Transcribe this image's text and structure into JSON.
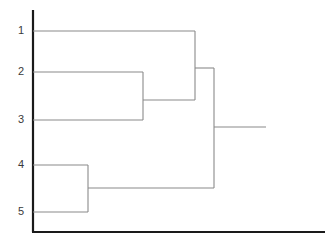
{
  "chart_data": {
    "type": "dendrogram",
    "title": "",
    "xlabel": "",
    "ylabel": "",
    "grid": false,
    "legend": null,
    "leaf_labels": [
      "1",
      "2",
      "3",
      "4",
      "5"
    ],
    "leaf_positions_px": [
      31,
      72,
      120,
      165,
      212
    ],
    "axis": {
      "vertical_x_px": 33,
      "vertical_y_top_px": 10,
      "vertical_y_bottom_px": 232,
      "horizontal_y_px": 232,
      "horizontal_x_end_px": 325,
      "color": "#1a1a1a"
    },
    "orientation": "horizontal-left-to-right",
    "link_color": "#8a8a8a",
    "merges": [
      {
        "id": "m1",
        "label": "merge-2-3",
        "members": [
          "2",
          "3"
        ],
        "height_px": 143,
        "child_y_px": [
          72,
          120
        ],
        "branch_y_px": 100
      },
      {
        "id": "m2",
        "label": "merge-1-with-23",
        "members": [
          "1",
          "2",
          "3"
        ],
        "height_px": 195,
        "child_y_px": [
          31,
          100
        ],
        "branch_y_px": 68
      },
      {
        "id": "m3",
        "label": "merge-4-5",
        "members": [
          "4",
          "5"
        ],
        "height_px": 88,
        "child_y_px": [
          165,
          212
        ],
        "branch_y_px": 188
      },
      {
        "id": "m4",
        "label": "root-merge-123-with-45",
        "members": [
          "1",
          "2",
          "3",
          "4",
          "5"
        ],
        "height_px": 214,
        "child_y_px": [
          68,
          188
        ],
        "branch_y_px": 127,
        "root_stub_x_end_px": 266
      }
    ],
    "segments": [
      {
        "name": "leaf-1-branch",
        "x1": 33,
        "y1": 31,
        "x2": 195,
        "y2": 31
      },
      {
        "name": "leaf-2-branch",
        "x1": 33,
        "y1": 72,
        "x2": 143,
        "y2": 72
      },
      {
        "name": "leaf-3-branch",
        "x1": 33,
        "y1": 120,
        "x2": 143,
        "y2": 120
      },
      {
        "name": "leaf-4-branch",
        "x1": 33,
        "y1": 165,
        "x2": 88,
        "y2": 165
      },
      {
        "name": "leaf-5-branch",
        "x1": 33,
        "y1": 212,
        "x2": 88,
        "y2": 212
      },
      {
        "name": "merge-2-3-vertical",
        "x1": 143,
        "y1": 72,
        "x2": 143,
        "y2": 120
      },
      {
        "name": "merge-2-3-branch",
        "x1": 143,
        "y1": 100,
        "x2": 195,
        "y2": 100
      },
      {
        "name": "merge-1-23-vertical",
        "x1": 195,
        "y1": 31,
        "x2": 195,
        "y2": 100
      },
      {
        "name": "merge-1-23-branch",
        "x1": 195,
        "y1": 68,
        "x2": 214,
        "y2": 68
      },
      {
        "name": "merge-4-5-vertical",
        "x1": 88,
        "y1": 165,
        "x2": 88,
        "y2": 212
      },
      {
        "name": "merge-4-5-branch",
        "x1": 88,
        "y1": 188,
        "x2": 214,
        "y2": 188
      },
      {
        "name": "root-vertical",
        "x1": 214,
        "y1": 68,
        "x2": 214,
        "y2": 188
      },
      {
        "name": "root-stub",
        "x1": 214,
        "y1": 127,
        "x2": 266,
        "y2": 127
      }
    ]
  },
  "labels": {
    "leaf_1": "1",
    "leaf_2": "2",
    "leaf_3": "3",
    "leaf_4": "4",
    "leaf_5": "5"
  }
}
